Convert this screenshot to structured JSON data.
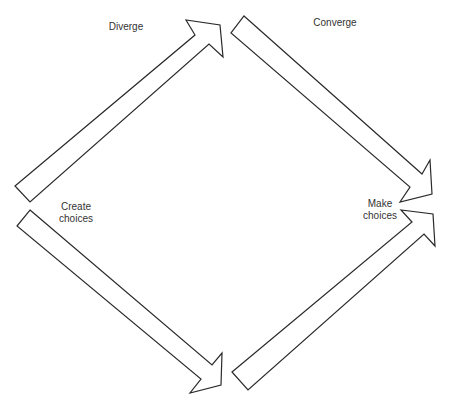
{
  "diagram": {
    "labels": {
      "diverge": "Diverge",
      "converge": "Converge",
      "create_choices": "Create\nchoices",
      "make_choices": "Make\nchoices"
    },
    "colors": {
      "stroke": "#2a2a2a",
      "fill": "#ffffff",
      "text": "#333333"
    },
    "arrows": [
      {
        "name": "diverge-arrow",
        "direction": "up-right"
      },
      {
        "name": "converge-arrow",
        "direction": "down-right"
      },
      {
        "name": "lower-left-arrow",
        "direction": "down-right"
      },
      {
        "name": "lower-right-arrow",
        "direction": "up-right"
      }
    ]
  }
}
